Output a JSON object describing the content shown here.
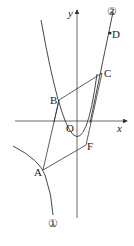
{
  "diagram": {
    "axes": {
      "x_label": "x",
      "y_label": "y",
      "origin_label": "O"
    },
    "points": {
      "A": "A",
      "B": "B",
      "C": "C",
      "D": "D",
      "F": "F"
    },
    "curves": {
      "curve1": "①",
      "curve2": "②"
    },
    "colors": {
      "stroke": "#333333",
      "background": "#ffffff"
    }
  }
}
